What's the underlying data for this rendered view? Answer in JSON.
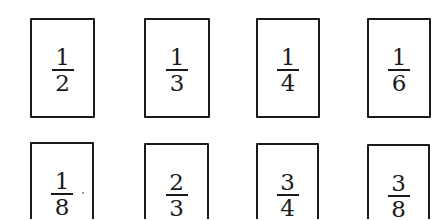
{
  "cards": [
    {
      "numerator": "1",
      "denominator": "2"
    },
    {
      "numerator": "1",
      "denominator": "3"
    },
    {
      "numerator": "1",
      "denominator": "4"
    },
    {
      "numerator": "1",
      "denominator": "6"
    },
    {
      "numerator": "1",
      "denominator": "8"
    },
    {
      "numerator": "2",
      "denominator": "3"
    },
    {
      "numerator": "3",
      "denominator": "4"
    },
    {
      "numerator": "3",
      "denominator": "8"
    }
  ],
  "colors": {
    "border": "#1a1a1a",
    "text": "#1a1a1a",
    "background": "#ffffff"
  }
}
